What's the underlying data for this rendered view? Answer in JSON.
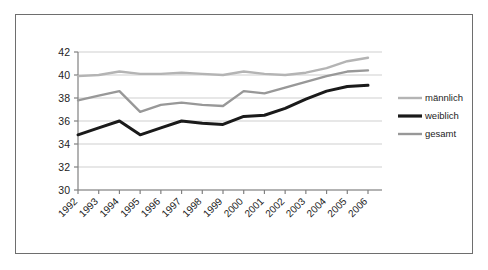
{
  "figure": {
    "frame_color": "#6e6e6e",
    "background": "#ffffff"
  },
  "chart_data": {
    "type": "line",
    "title": "",
    "subtitle": "",
    "xlabel": "",
    "ylabel": "",
    "categories": [
      "1992",
      "1993",
      "1994",
      "1995",
      "1996",
      "1997",
      "1998",
      "1999",
      "2000",
      "2001",
      "2002",
      "2003",
      "2004",
      "2005",
      "2006"
    ],
    "ylim": [
      30,
      42
    ],
    "yticks": [
      30,
      32,
      34,
      36,
      38,
      40,
      42
    ],
    "ytick_labels": [
      "30",
      "32",
      "34",
      "36",
      "38",
      "40",
      "42"
    ],
    "grid": true,
    "grid_axis": "y",
    "grid_color": "#cfcfcf",
    "legend_position": "right",
    "series": [
      {
        "name": "männlich",
        "color": "#b4b4b4",
        "width": 2.4,
        "values": [
          39.9,
          40.0,
          40.3,
          40.1,
          40.1,
          40.2,
          40.1,
          40.0,
          40.3,
          40.1,
          40.0,
          40.2,
          40.6,
          41.2,
          41.5
        ]
      },
      {
        "name": "weiblich",
        "color": "#1a1a1a",
        "width": 3.0,
        "values": [
          34.8,
          35.4,
          36.0,
          34.8,
          35.4,
          36.0,
          35.8,
          35.7,
          36.4,
          36.5,
          37.1,
          37.9,
          38.6,
          39.0,
          39.1
        ]
      },
      {
        "name": "gesamt",
        "color": "#989898",
        "width": 2.4,
        "values": [
          37.8,
          38.2,
          38.6,
          36.8,
          37.4,
          37.6,
          37.4,
          37.3,
          38.6,
          38.4,
          38.9,
          39.4,
          39.9,
          40.3,
          40.4
        ]
      }
    ]
  },
  "legend": {
    "items": [
      {
        "label": "männlich",
        "color": "#b4b4b4",
        "width": 2.4
      },
      {
        "label": "weiblich",
        "color": "#1a1a1a",
        "width": 3.2
      },
      {
        "label": "gesamt",
        "color": "#989898",
        "width": 2.4
      }
    ]
  }
}
